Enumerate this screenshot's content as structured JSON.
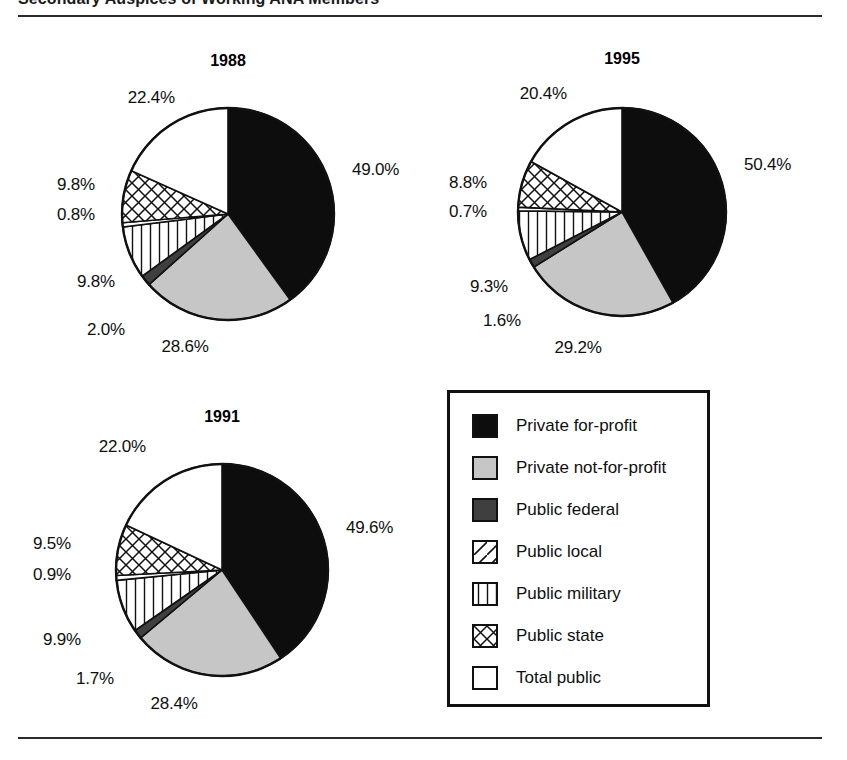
{
  "figure": {
    "title": "Secondary Auspices of Working ANA Members",
    "rule_color": "#2b2b2b"
  },
  "legend": {
    "items": [
      {
        "label": "Private for-profit",
        "pattern": "solid-black",
        "color": "#0d0d0d"
      },
      {
        "label": "Private not-for-profit",
        "pattern": "solid-light",
        "color": "#c6c6c6"
      },
      {
        "label": "Public federal",
        "pattern": "solid-dark",
        "color": "#3f3f3f"
      },
      {
        "label": "Public local",
        "pattern": "diag-backward",
        "color": "#ffffff"
      },
      {
        "label": "Public military",
        "pattern": "diag-forward",
        "color": "#ffffff"
      },
      {
        "label": "Public state",
        "pattern": "crosshatch",
        "color": "#ffffff"
      },
      {
        "label": "Total public",
        "pattern": "white",
        "color": "#ffffff"
      }
    ]
  },
  "charts": [
    {
      "id": "chart-1988",
      "title": "1988",
      "labels": [
        {
          "text": "49.0%",
          "align": "right",
          "x": 352,
          "y": 160
        },
        {
          "text": "28.6%",
          "align": "center",
          "x": 185,
          "y": 337
        },
        {
          "text": "2.0%",
          "align": "center",
          "x": 106,
          "y": 320
        },
        {
          "text": "9.8%",
          "align": "left",
          "x": 115,
          "y": 272
        },
        {
          "text": "0.8%",
          "align": "left",
          "x": 95,
          "y": 205
        },
        {
          "text": "9.8%",
          "align": "left",
          "x": 95,
          "y": 175
        },
        {
          "text": "22.4%",
          "align": "left",
          "x": 175,
          "y": 88
        }
      ]
    },
    {
      "id": "chart-1995",
      "title": "1995",
      "labels": [
        {
          "text": "50.4%",
          "align": "right",
          "x": 744,
          "y": 155
        },
        {
          "text": "29.2%",
          "align": "center",
          "x": 578,
          "y": 338
        },
        {
          "text": "1.6%",
          "align": "center",
          "x": 502,
          "y": 311
        },
        {
          "text": "9.3%",
          "align": "left",
          "x": 508,
          "y": 277
        },
        {
          "text": "0.7%",
          "align": "left",
          "x": 487,
          "y": 202
        },
        {
          "text": "8.8%",
          "align": "left",
          "x": 487,
          "y": 173
        },
        {
          "text": "20.4%",
          "align": "left",
          "x": 567,
          "y": 84
        }
      ]
    },
    {
      "id": "chart-1991",
      "title": "1991",
      "labels": [
        {
          "text": "49.6%",
          "align": "right",
          "x": 346,
          "y": 518
        },
        {
          "text": "28.4%",
          "align": "center",
          "x": 174,
          "y": 694
        },
        {
          "text": "1.7%",
          "align": "center",
          "x": 95,
          "y": 669
        },
        {
          "text": "9.9%",
          "align": "left",
          "x": 81,
          "y": 630
        },
        {
          "text": "0.9%",
          "align": "left",
          "x": 71,
          "y": 565
        },
        {
          "text": "9.5%",
          "align": "left",
          "x": 71,
          "y": 534
        },
        {
          "text": "22.0%",
          "align": "left",
          "x": 146,
          "y": 437
        }
      ]
    }
  ],
  "chart_data": [
    {
      "type": "pie",
      "title": "1988",
      "categories": [
        "Private for-profit",
        "Private not-for-profit",
        "Public federal",
        "Public local",
        "Public military",
        "Public state",
        "Total public"
      ],
      "values": [
        49.0,
        28.6,
        2.0,
        9.8,
        0.8,
        9.8,
        22.4
      ],
      "labels": [
        "49.0%",
        "28.6%",
        "2.0%",
        "9.8%",
        "0.8%",
        "9.8%",
        "22.4%"
      ],
      "start_angle": 0,
      "direction": "clockwise",
      "legend_position": "bottom-right"
    },
    {
      "type": "pie",
      "title": "1991",
      "categories": [
        "Private for-profit",
        "Private not-for-profit",
        "Public federal",
        "Public local",
        "Public military",
        "Public state",
        "Total public"
      ],
      "values": [
        49.6,
        28.4,
        1.7,
        9.9,
        0.9,
        9.5,
        22.0
      ],
      "labels": [
        "49.6%",
        "28.4%",
        "1.7%",
        "9.9%",
        "0.9%",
        "9.5%",
        "22.0%"
      ],
      "start_angle": 0,
      "direction": "clockwise",
      "legend_position": "bottom-right"
    },
    {
      "type": "pie",
      "title": "1995",
      "categories": [
        "Private for-profit",
        "Private not-for-profit",
        "Public federal",
        "Public local",
        "Public military",
        "Public state",
        "Total public"
      ],
      "values": [
        50.4,
        29.2,
        1.6,
        9.3,
        0.7,
        8.8,
        20.4
      ],
      "labels": [
        "50.4%",
        "29.2%",
        "1.6%",
        "9.3%",
        "0.7%",
        "8.8%",
        "20.4%"
      ],
      "start_angle": 0,
      "direction": "clockwise",
      "legend_position": "bottom-right"
    }
  ],
  "geometry": {
    "pies": [
      {
        "id": "chart-1988",
        "cx": 228,
        "cy": 214,
        "r": 106,
        "title_x": 228,
        "title_y": 52
      },
      {
        "id": "chart-1995",
        "cx": 622,
        "cy": 212,
        "r": 104,
        "title_x": 622,
        "title_y": 50
      },
      {
        "id": "chart-1991",
        "cx": 222,
        "cy": 570,
        "r": 106,
        "title_x": 222,
        "title_y": 408
      }
    ]
  }
}
